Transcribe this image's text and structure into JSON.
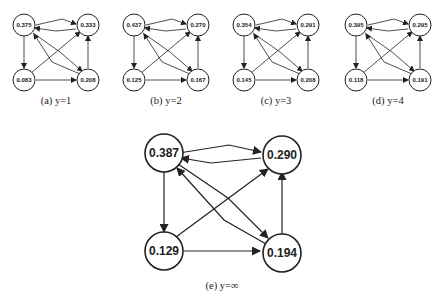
{
  "subfigures": [
    {
      "id": "a",
      "caption": "(a)  y=1",
      "nodes": {
        "top_left": "0.375",
        "top_right": "0.333",
        "bottom_left": "0.083",
        "bottom_right": "0.208"
      }
    },
    {
      "id": "b",
      "caption": "(b)  y=2",
      "nodes": {
        "top_left": "0.437",
        "top_right": "0.270",
        "bottom_left": "0.125",
        "bottom_right": "0.167"
      }
    },
    {
      "id": "c",
      "caption": "(c)  y=3",
      "nodes": {
        "top_left": "0.354",
        "top_right": "0.291",
        "bottom_left": "0.145",
        "bottom_right": "0.208"
      }
    },
    {
      "id": "d",
      "caption": "(d)  y=4",
      "nodes": {
        "top_left": "0.395",
        "top_right": "0.295",
        "bottom_left": "0.118",
        "bottom_right": "0.191"
      }
    },
    {
      "id": "e",
      "caption": "(e)  y=∞",
      "nodes": {
        "top_left": "0.387",
        "top_right": "0.290",
        "bottom_left": "0.129",
        "bottom_right": "0.194"
      }
    }
  ],
  "edges": [
    {
      "from": "top_left",
      "to": "top_right"
    },
    {
      "from": "top_right",
      "to": "top_left"
    },
    {
      "from": "top_left",
      "to": "bottom_left"
    },
    {
      "from": "top_left",
      "to": "bottom_right"
    },
    {
      "from": "bottom_right",
      "to": "top_left"
    },
    {
      "from": "bottom_left",
      "to": "top_right"
    },
    {
      "from": "bottom_left",
      "to": "bottom_right"
    },
    {
      "from": "bottom_right",
      "to": "top_right"
    }
  ]
}
